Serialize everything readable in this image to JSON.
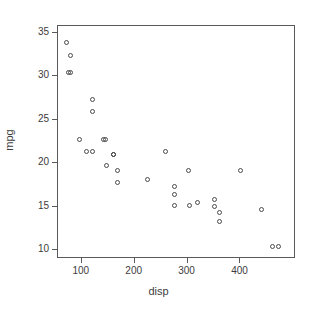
{
  "chart_data": {
    "type": "scatter",
    "title": "",
    "xlabel": "disp",
    "ylabel": "mpg",
    "xlim": [
      55,
      505
    ],
    "ylim": [
      9,
      35.8
    ],
    "grid": false,
    "legend": null,
    "marker": "open-circle",
    "marker_color": "#4a4a4a",
    "xticks": [
      100,
      200,
      300,
      400
    ],
    "xtick_labels": [
      "100",
      "200",
      "300",
      "400"
    ],
    "yticks": [
      10,
      15,
      20,
      25,
      30,
      35
    ],
    "ytick_labels": [
      "10",
      "15",
      "20",
      "25",
      "30",
      "35"
    ],
    "x": [
      71.1,
      75.7,
      78.7,
      79.0,
      95.1,
      108.0,
      120.1,
      120.3,
      121.0,
      140.8,
      145.0,
      146.7,
      160.0,
      160.0,
      167.6,
      167.6,
      225.0,
      258.0,
      275.8,
      275.8,
      275.8,
      301.0,
      304.0,
      318.0,
      350.0,
      351.0,
      360.0,
      360.0,
      400.0,
      440.0,
      460.0,
      472.0
    ],
    "y": [
      33.9,
      30.4,
      32.4,
      30.4,
      22.8,
      21.4,
      21.4,
      26.0,
      27.3,
      22.8,
      22.8,
      19.7,
      21.0,
      21.0,
      19.2,
      17.8,
      18.1,
      21.4,
      16.4,
      17.3,
      15.2,
      19.2,
      15.2,
      15.5,
      15.8,
      15.0,
      14.3,
      13.3,
      19.2,
      14.7,
      10.4,
      10.4
    ],
    "n_points": 32,
    "series_name": "mtcars"
  },
  "axes": {
    "xlabel": "disp",
    "ylabel": "mpg"
  }
}
